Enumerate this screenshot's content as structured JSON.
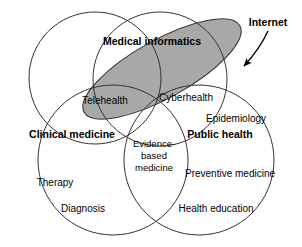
{
  "diagram": {
    "type": "venn-diagram",
    "background_color": "#ffffff",
    "stroke_color": "#333333",
    "shaded_fill_color": "#a8a8a8",
    "sets": [
      {
        "id": "medical-informatics",
        "label": "Medical informatics",
        "emphasis": "bold",
        "shape": "circle"
      },
      {
        "id": "clinical-medicine",
        "label": "Clinical medicine",
        "emphasis": "bold",
        "shape": "circle"
      },
      {
        "id": "public-health",
        "label": "Public health",
        "emphasis": "bold",
        "shape": "circle"
      },
      {
        "id": "internet",
        "label": "Internet",
        "emphasis": "bold",
        "shape": "ellipse",
        "shaded": true
      }
    ],
    "region_labels": [
      {
        "id": "telehealth",
        "label": "Telehealth"
      },
      {
        "id": "cyberhealth",
        "label": "Cyberhealth"
      },
      {
        "id": "epidemiology",
        "label": "Epidemiology"
      },
      {
        "id": "evidence-based-medicine-line1",
        "label": "Evidence-"
      },
      {
        "id": "evidence-based-medicine-line2",
        "label": "based"
      },
      {
        "id": "evidence-based-medicine-line3",
        "label": "medicine"
      },
      {
        "id": "preventive-medicine",
        "label": "Preventive medicine"
      },
      {
        "id": "therapy",
        "label": "Therapy"
      },
      {
        "id": "diagnosis",
        "label": "Diagnosis"
      },
      {
        "id": "health-education",
        "label": "Health education"
      }
    ],
    "annotation": {
      "id": "internet-arrow",
      "label": "Internet",
      "points_to": "shaded-internet-ellipse"
    }
  }
}
